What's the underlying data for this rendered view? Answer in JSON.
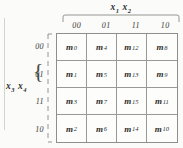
{
  "figure": {
    "type": "karnaugh-map",
    "top_variable_label": "x₁ x₂",
    "top_variable_base": "x",
    "top_variable_subs": [
      "1",
      "2"
    ],
    "left_variable_label": "x₃ x₄",
    "left_variable_base": "x",
    "left_variable_subs": [
      "3",
      "4"
    ],
    "column_headers": [
      "00",
      "01",
      "11",
      "10"
    ],
    "row_headers": [
      "00",
      "01",
      "11",
      "10"
    ],
    "brace_glyph": "{",
    "cells": [
      {
        "base": "m",
        "sub": "0",
        "label": "m0"
      },
      {
        "base": "m",
        "sub": "4",
        "label": "m4"
      },
      {
        "base": "m",
        "sub": "12",
        "label": "m12"
      },
      {
        "base": "m",
        "sub": "8",
        "label": "m8"
      },
      {
        "base": "m",
        "sub": "1",
        "label": "m1"
      },
      {
        "base": "m",
        "sub": "5",
        "label": "m5"
      },
      {
        "base": "m",
        "sub": "13",
        "label": "m13"
      },
      {
        "base": "m",
        "sub": "9",
        "label": "m9"
      },
      {
        "base": "m",
        "sub": "3",
        "label": "m3"
      },
      {
        "base": "m",
        "sub": "7",
        "label": "m7"
      },
      {
        "base": "m",
        "sub": "15",
        "label": "m15"
      },
      {
        "base": "m",
        "sub": "11",
        "label": "m11"
      },
      {
        "base": "m",
        "sub": "2",
        "label": "m2"
      },
      {
        "base": "m",
        "sub": "6",
        "label": "m6"
      },
      {
        "base": "m",
        "sub": "14",
        "label": "m14"
      },
      {
        "base": "m",
        "sub": "10",
        "label": "m10"
      }
    ],
    "colors": {
      "background": "#fbfbf9",
      "grid_line": "#9a9a95",
      "grid_border": "#8f8f8a",
      "text": "#2f2f2f",
      "brace": "#4a4a4a",
      "page_rule": "#d2d2ce"
    }
  }
}
